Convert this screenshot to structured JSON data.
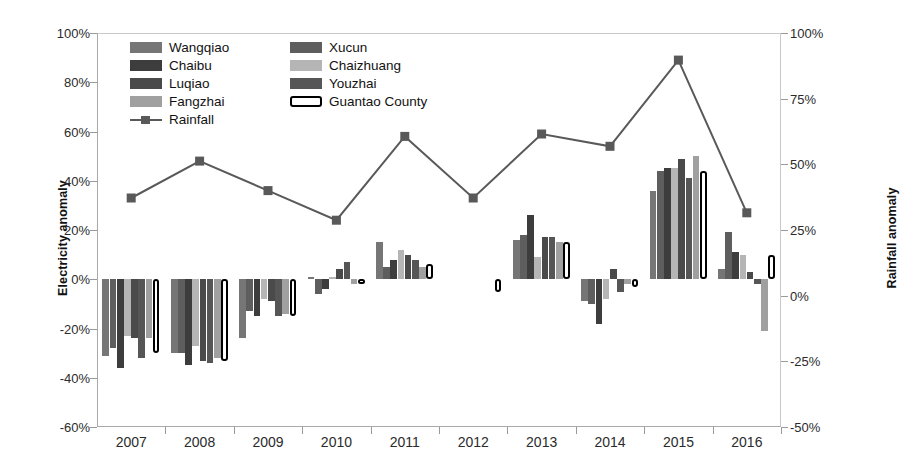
{
  "chart_data": {
    "type": "bar",
    "title": "",
    "xlabel": "",
    "ylabel": "Electricity anomaly",
    "y2label": "Rainfall anomaly",
    "categories": [
      "2007",
      "2008",
      "2009",
      "2010",
      "2011",
      "2012",
      "2013",
      "2014",
      "2015",
      "2016"
    ],
    "ylim": [
      -60,
      100
    ],
    "yticks": [
      "-60%",
      "-40%",
      "-20%",
      "0%",
      "20%",
      "40%",
      "60%",
      "80%",
      "100%"
    ],
    "ytick_values": [
      -60,
      -40,
      -20,
      0,
      20,
      40,
      60,
      80,
      100
    ],
    "y2lim": [
      100,
      -50
    ],
    "y2ticks": [
      "100%",
      "75%",
      "50%",
      "25%",
      "0%",
      "-25%",
      "-50%"
    ],
    "y2tick_values": [
      100,
      75,
      50,
      25,
      0,
      -25,
      -50
    ],
    "grid": false,
    "legend_position": "top-left-inside",
    "series": [
      {
        "name": "Wangqiao",
        "color": "#767676",
        "values": [
          -31,
          -30,
          -24,
          1,
          15,
          null,
          16,
          -9,
          36,
          4
        ]
      },
      {
        "name": "Xucun",
        "color": "#5e5e5e",
        "values": [
          -28,
          -30,
          -13,
          -6,
          5,
          null,
          18,
          -10,
          44,
          19
        ]
      },
      {
        "name": "Chaibu",
        "color": "#3d3d3d",
        "values": [
          -36,
          -35,
          -15,
          -4,
          8,
          null,
          26,
          -18,
          45,
          11
        ]
      },
      {
        "name": "Chaizhuang",
        "color": "#b5b5b5",
        "values": [
          -23,
          -27,
          -8,
          1,
          12,
          null,
          9,
          -8,
          45,
          10
        ]
      },
      {
        "name": "Luqiao",
        "color": "#4a4a4a",
        "values": [
          -24,
          -33,
          -9,
          4,
          10,
          null,
          17,
          4,
          49,
          3
        ]
      },
      {
        "name": "Youzhai",
        "color": "#565656",
        "values": [
          -32,
          -34,
          -15,
          7,
          8,
          null,
          17,
          -5,
          41,
          -2
        ]
      },
      {
        "name": "Fangzhai",
        "color": "#a0a0a0",
        "values": [
          -24,
          -32,
          -14,
          -2,
          5,
          null,
          15,
          -2,
          50,
          -21
        ]
      },
      {
        "name": "Guantao County",
        "color": "#ffffff",
        "outline": "#000000",
        "values": [
          -30,
          -33,
          -15,
          -2,
          6,
          -5,
          15,
          -3,
          44,
          10
        ]
      }
    ],
    "line_series": {
      "name": "Rainfall",
      "color": "#595959",
      "marker": "square",
      "axis": "y2",
      "values_left_scale": [
        33,
        48,
        36,
        24,
        58,
        33,
        59,
        54,
        89,
        27
      ],
      "values": [
        42,
        33,
        40,
        48,
        26,
        42,
        25,
        29,
        7,
        46
      ]
    }
  },
  "legend": {
    "items": [
      {
        "label": "Wangqiao",
        "swatch": "#767676",
        "type": "bar"
      },
      {
        "label": "Xucun",
        "swatch": "#5e5e5e",
        "type": "bar"
      },
      {
        "label": "Chaibu",
        "swatch": "#3d3d3d",
        "type": "bar"
      },
      {
        "label": "Chaizhuang",
        "swatch": "#b5b5b5",
        "type": "bar"
      },
      {
        "label": "Luqiao",
        "swatch": "#4a4a4a",
        "type": "bar"
      },
      {
        "label": "Youzhai",
        "swatch": "#565656",
        "type": "bar"
      },
      {
        "label": "Fangzhai",
        "swatch": "#a0a0a0",
        "type": "bar"
      },
      {
        "label": "Guantao County",
        "swatch": "#ffffff",
        "type": "bar-outlined"
      },
      {
        "label": "Rainfall",
        "swatch": "#595959",
        "type": "line"
      }
    ]
  }
}
